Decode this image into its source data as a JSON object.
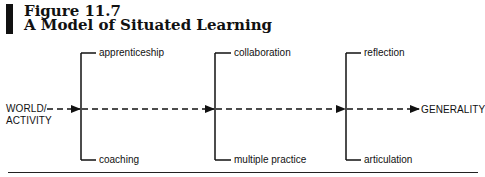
{
  "figure": {
    "number": "Figure 11.7",
    "title": "A Model of Situated Learning"
  },
  "flow": {
    "start": [
      "WORLD/",
      "ACTIVITY"
    ],
    "end": "GENERALITY"
  },
  "stages": [
    {
      "top": "apprenticeship",
      "bottom": "coaching"
    },
    {
      "top": "collaboration",
      "bottom": "multiple practice"
    },
    {
      "top": "reflection",
      "bottom": "articulation"
    }
  ],
  "colors": {
    "ink": "#111111",
    "background": "#ffffff"
  }
}
